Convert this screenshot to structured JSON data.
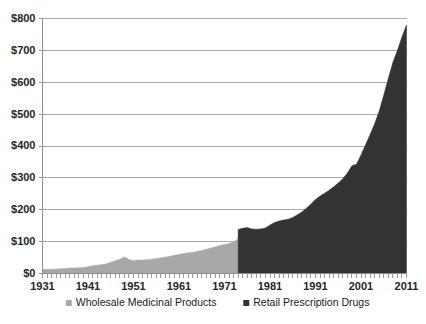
{
  "chart_data": {
    "type": "area",
    "title": "",
    "subtitle": "",
    "xlabel": "",
    "ylabel": "",
    "xlim": [
      1931,
      2011
    ],
    "ylim": [
      0,
      800
    ],
    "grid": true,
    "legend_position": "bottom",
    "y_ticks": [
      0,
      100,
      200,
      300,
      400,
      500,
      600,
      700,
      800
    ],
    "y_tick_labels": [
      "$0",
      "$100",
      "$200",
      "$300",
      "$400",
      "$500",
      "$600",
      "$700",
      "$800"
    ],
    "x_ticks": [
      1931,
      1941,
      1951,
      1961,
      1971,
      1981,
      1991,
      2001,
      2011
    ],
    "x_tick_labels": [
      "1931",
      "1941",
      "1951",
      "1961",
      "1971",
      "1981",
      "1991",
      "2001",
      "2011"
    ],
    "x_minor_tick_interval": 1,
    "series": [
      {
        "name": "Wholesale Medicinal Products",
        "color": "#a8a8a8",
        "x": [
          1931,
          1932,
          1933,
          1934,
          1935,
          1936,
          1937,
          1938,
          1939,
          1940,
          1941,
          1942,
          1943,
          1944,
          1945,
          1946,
          1947,
          1948,
          1949,
          1950,
          1951,
          1952,
          1953,
          1954,
          1955,
          1956,
          1957,
          1958,
          1959,
          1960,
          1961,
          1962,
          1963,
          1964,
          1965,
          1966,
          1967,
          1968,
          1969,
          1970,
          1971,
          1972,
          1973,
          1974
        ],
        "values": [
          14,
          13,
          13,
          14,
          15,
          16,
          17,
          17,
          18,
          19,
          21,
          24,
          26,
          28,
          30,
          35,
          40,
          45,
          52,
          44,
          41,
          42,
          42,
          43,
          45,
          47,
          49,
          51,
          54,
          57,
          60,
          63,
          65,
          66,
          69,
          72,
          76,
          80,
          84,
          88,
          91,
          94,
          99,
          109
        ]
      },
      {
        "name": "Retail Prescription Drugs",
        "color": "#333333",
        "x": [
          1974,
          1975,
          1976,
          1977,
          1978,
          1979,
          1980,
          1981,
          1982,
          1983,
          1984,
          1985,
          1986,
          1987,
          1988,
          1989,
          1990,
          1991,
          1992,
          1993,
          1994,
          1995,
          1996,
          1997,
          1998,
          1999,
          2000,
          2001,
          2002,
          2003,
          2004,
          2005,
          2006,
          2007,
          2008,
          2009,
          2010,
          2011
        ],
        "values": [
          138,
          142,
          144,
          140,
          139,
          140,
          143,
          152,
          160,
          165,
          168,
          170,
          176,
          184,
          193,
          205,
          218,
          232,
          243,
          252,
          261,
          272,
          284,
          297,
          315,
          338,
          343,
          372,
          404,
          436,
          470,
          510,
          560,
          612,
          662,
          700,
          742,
          780
        ]
      }
    ]
  },
  "legend": {
    "items": [
      {
        "label": "Wholesale Medicinal Products",
        "color": "#a8a8a8"
      },
      {
        "label": "Retail Prescription Drugs",
        "color": "#333333"
      }
    ]
  }
}
